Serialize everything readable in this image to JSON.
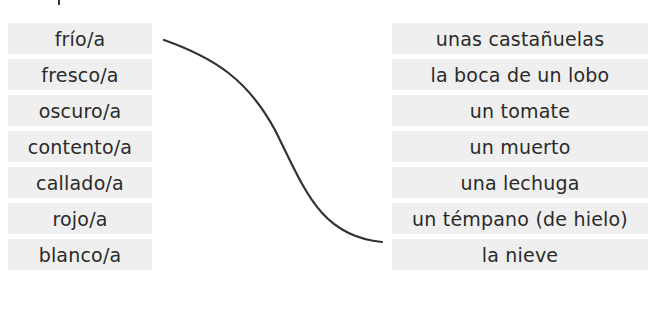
{
  "exercise": {
    "left_items": [
      {
        "label": "frío/a"
      },
      {
        "label": "fresco/a"
      },
      {
        "label": "oscuro/a"
      },
      {
        "label": "contento/a"
      },
      {
        "label": "callado/a"
      },
      {
        "label": "rojo/a"
      },
      {
        "label": "blanco/a"
      }
    ],
    "right_items": [
      {
        "label": "unas castañuelas"
      },
      {
        "label": "la boca de un lobo"
      },
      {
        "label": "un tomate"
      },
      {
        "label": "un muerto"
      },
      {
        "label": "una lechuga"
      },
      {
        "label": "un témpano (de hielo)"
      },
      {
        "label": "la nieve"
      }
    ],
    "connections": [
      {
        "from": "frío/a",
        "to": "un témpano (de hielo)"
      }
    ],
    "colors": {
      "box_background": "#efefef",
      "text": "#2a2a2a",
      "line": "#333333"
    }
  }
}
